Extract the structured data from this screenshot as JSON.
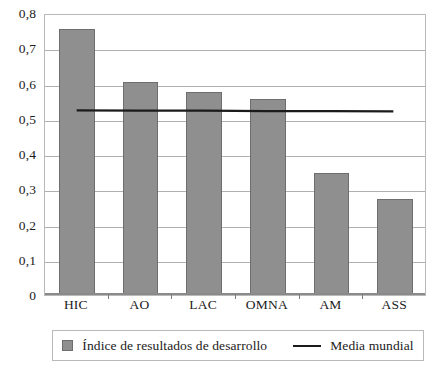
{
  "chart_data": {
    "type": "bar",
    "title": "",
    "subtitle": "",
    "xlabel": "",
    "ylabel": "",
    "categories": [
      "HIC",
      "AO",
      "LAC",
      "OMNA",
      "AM",
      "ASS"
    ],
    "series": [
      {
        "name": "Índice de resultados de desarrollo",
        "type": "bar",
        "color": "#8f8f8f",
        "values": [
          0.755,
          0.605,
          0.575,
          0.555,
          0.345,
          0.272
        ]
      },
      {
        "name": "Media mundial",
        "type": "line",
        "color": "#1b1b1b",
        "values": [
          0.528,
          0.527,
          0.527,
          0.526,
          0.526,
          0.525
        ]
      }
    ],
    "ylim": [
      0,
      0.8
    ],
    "ytick_values": [
      0.8,
      0.7,
      0.6,
      0.5,
      0.4,
      0.3,
      0.2,
      0.1,
      0
    ],
    "ytick_labels": [
      "0,8",
      "0,7",
      "0,6",
      "0,5",
      "0,4",
      "0,3",
      "0,2",
      "0,1",
      "0"
    ],
    "grid": true,
    "legend_position": "bottom",
    "decimal_separator": ","
  },
  "legend": {
    "entries": [
      {
        "label": "Índice de resultados de desarrollo",
        "marker": "square-swatch"
      },
      {
        "label": "Media mundial",
        "marker": "line-swatch"
      }
    ]
  },
  "colors": {
    "bar_fill": "#8f8f8f",
    "bar_stroke": "#6e6e6e",
    "mean_line": "#1b1b1b",
    "gridline": "#b0b0b0",
    "plot_border": "#b9b9b9",
    "axis": "#8a8a8a",
    "text": "#1b1b1b",
    "background": "#ffffff"
  }
}
